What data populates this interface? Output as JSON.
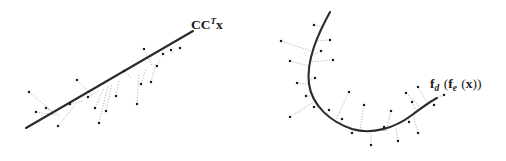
{
  "figure": {
    "background_color": "#ffffff",
    "width": 506,
    "height": 161,
    "style": {
      "manifold_color": "#2b2b2b",
      "manifold_width": 2.1,
      "point_color": "#1c1c1c",
      "point_size": 2.2,
      "residual_color": "#a9a9a9",
      "residual_width": 0.9
    }
  },
  "panels": [
    {
      "id": "linear-projection",
      "name": "Linear subspace projection panel",
      "label": {
        "base_1": "CC",
        "superscript": "T",
        "base_2": "x",
        "full_text": "CCTx",
        "x": 191,
        "y": 29
      },
      "manifold": {
        "type": "line",
        "path": "M 26 128 L 193 31",
        "x1": 26,
        "y1": 128,
        "x2": 193,
        "y2": 31
      },
      "points": [
        {
          "x": 29,
          "y": 92,
          "px": 54,
          "py": 113
        },
        {
          "x": 46,
          "y": 108,
          "px": 60,
          "py": 116
        },
        {
          "x": 58,
          "y": 126,
          "px": 75,
          "py": 105
        },
        {
          "x": 70,
          "y": 104,
          "px": 83,
          "py": 101
        },
        {
          "x": 77,
          "y": 80,
          "px": 92,
          "py": 95
        },
        {
          "x": 36,
          "y": 112,
          "px": 56,
          "py": 115
        },
        {
          "x": 95,
          "y": 108,
          "px": 104,
          "py": 88
        },
        {
          "x": 106,
          "y": 111,
          "px": 112,
          "py": 84
        },
        {
          "x": 88,
          "y": 97,
          "px": 100,
          "py": 90
        },
        {
          "x": 116,
          "y": 96,
          "px": 119,
          "py": 80
        },
        {
          "x": 124,
          "y": 71,
          "px": 131,
          "py": 78
        },
        {
          "x": 99,
          "y": 123,
          "px": 108,
          "py": 86
        },
        {
          "x": 137,
          "y": 104,
          "px": 139,
          "py": 74
        },
        {
          "x": 141,
          "y": 84,
          "px": 146,
          "py": 69
        },
        {
          "x": 144,
          "y": 49,
          "px": 152,
          "py": 65
        },
        {
          "x": 151,
          "y": 82,
          "px": 156,
          "py": 63
        },
        {
          "x": 157,
          "y": 66,
          "px": 160,
          "py": 60
        },
        {
          "x": 163,
          "y": 54,
          "px": 166,
          "py": 56
        },
        {
          "x": 171,
          "y": 50,
          "px": 173,
          "py": 53
        },
        {
          "x": 180,
          "y": 48,
          "px": 181,
          "py": 48
        }
      ]
    },
    {
      "id": "nonlinear-manifold",
      "name": "Nonlinear autoencoder manifold panel",
      "label": {
        "base_1": "f",
        "subscript_1": "d",
        "base_2": "f",
        "subscript_2": "e",
        "base_3": "x",
        "full_text": "fd (fe (x))",
        "x": 430,
        "y": 88
      },
      "manifold": {
        "type": "curve",
        "path": "M 330 12 C 318 34, 306 60, 309 84 C 312 106, 331 122, 352 129 C 372 135, 395 128, 412 115 C 424 106, 431 101, 437 98"
      },
      "points": [
        {
          "x": 314,
          "y": 25,
          "px": 322,
          "py": 27
        },
        {
          "x": 330,
          "y": 40,
          "px": 315,
          "py": 41
        },
        {
          "x": 281,
          "y": 41,
          "px": 311,
          "py": 51
        },
        {
          "x": 321,
          "y": 51,
          "px": 310,
          "py": 56
        },
        {
          "x": 290,
          "y": 61,
          "px": 309,
          "py": 66
        },
        {
          "x": 333,
          "y": 60,
          "px": 310,
          "py": 62
        },
        {
          "x": 315,
          "y": 78,
          "px": 309,
          "py": 80
        },
        {
          "x": 297,
          "y": 83,
          "px": 309,
          "py": 84
        },
        {
          "x": 306,
          "y": 96,
          "px": 311,
          "py": 96
        },
        {
          "x": 314,
          "y": 107,
          "px": 317,
          "py": 104
        },
        {
          "x": 290,
          "y": 117,
          "px": 314,
          "py": 102
        },
        {
          "x": 329,
          "y": 110,
          "px": 327,
          "py": 114
        },
        {
          "x": 342,
          "y": 119,
          "px": 340,
          "py": 124
        },
        {
          "x": 349,
          "y": 92,
          "px": 336,
          "py": 120
        },
        {
          "x": 364,
          "y": 105,
          "px": 360,
          "py": 131
        },
        {
          "x": 352,
          "y": 133,
          "px": 353,
          "py": 129
        },
        {
          "x": 371,
          "y": 145,
          "px": 371,
          "py": 133
        },
        {
          "x": 384,
          "y": 127,
          "px": 384,
          "py": 132
        },
        {
          "x": 391,
          "y": 111,
          "px": 386,
          "py": 131
        },
        {
          "x": 398,
          "y": 141,
          "px": 396,
          "py": 128
        },
        {
          "x": 409,
          "y": 122,
          "px": 408,
          "py": 118
        },
        {
          "x": 418,
          "y": 133,
          "px": 413,
          "py": 114
        },
        {
          "x": 412,
          "y": 102,
          "px": 416,
          "py": 110
        },
        {
          "x": 406,
          "y": 93,
          "px": 420,
          "py": 107
        },
        {
          "x": 418,
          "y": 87,
          "px": 427,
          "py": 102
        },
        {
          "x": 434,
          "y": 105,
          "px": 432,
          "py": 100
        },
        {
          "x": 444,
          "y": 95,
          "px": 436,
          "py": 98
        }
      ]
    }
  ]
}
